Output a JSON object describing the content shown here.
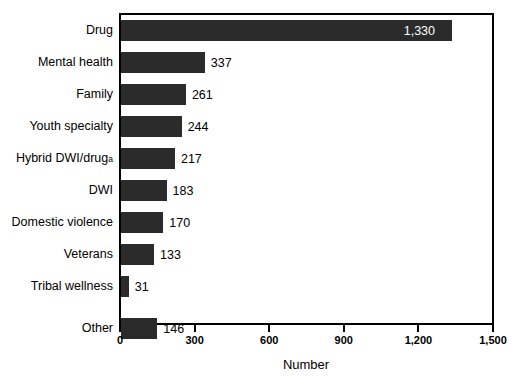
{
  "chart_data": {
    "type": "bar",
    "orientation": "horizontal",
    "title": "",
    "subtitle": "",
    "xlabel": "Number",
    "ylabel": "",
    "categories": [
      "Drug",
      "Mental health",
      "Family",
      "Youth specialty",
      "Hybrid DWI/drug",
      "DWI",
      "Domestic violence",
      "Veterans",
      "Tribal wellness",
      "Other"
    ],
    "category_footnotes": {
      "Hybrid DWI/drug": "a"
    },
    "values": [
      1330,
      337,
      261,
      244,
      217,
      183,
      170,
      133,
      31,
      146
    ],
    "value_labels": [
      "1,330",
      "337",
      "261",
      "244",
      "217",
      "183",
      "170",
      "133",
      "31",
      "146"
    ],
    "label_placement": [
      "inside",
      "outside",
      "outside",
      "outside",
      "outside",
      "outside",
      "outside",
      "outside",
      "outside",
      "outside"
    ],
    "xlim": [
      0,
      1500
    ],
    "xticks": [
      0,
      300,
      600,
      900,
      1200,
      1500
    ],
    "xtick_labels": [
      "0",
      "300",
      "600",
      "900",
      "1,200",
      "1,500"
    ],
    "grid": false,
    "legend": null,
    "bar_color": "#2b2b2b",
    "inside_label_color": "#ffffff",
    "outside_label_color": "#000000",
    "background_color": "#ffffff",
    "frame_color": "#000000"
  }
}
